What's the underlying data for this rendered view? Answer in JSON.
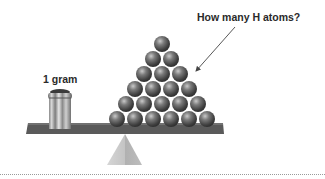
{
  "labels": {
    "weight": "1 gram",
    "question": "How many H atoms?"
  },
  "diagram": {
    "type": "balance-scale",
    "left_object": "metal-weight",
    "right_object": "pyramid-of-hydrogen-atoms",
    "pyramid_rows": [
      1,
      2,
      3,
      4,
      5,
      6
    ],
    "atom_count_visible": 21
  },
  "colors": {
    "plank": "#5a5a5a",
    "plank_top": "#6e6e6e",
    "atom": "#555555",
    "fulcrum": "#c8c8c8",
    "weight": "#9a9a9a",
    "text": "#2a2a2a",
    "arrow": "#444444"
  }
}
